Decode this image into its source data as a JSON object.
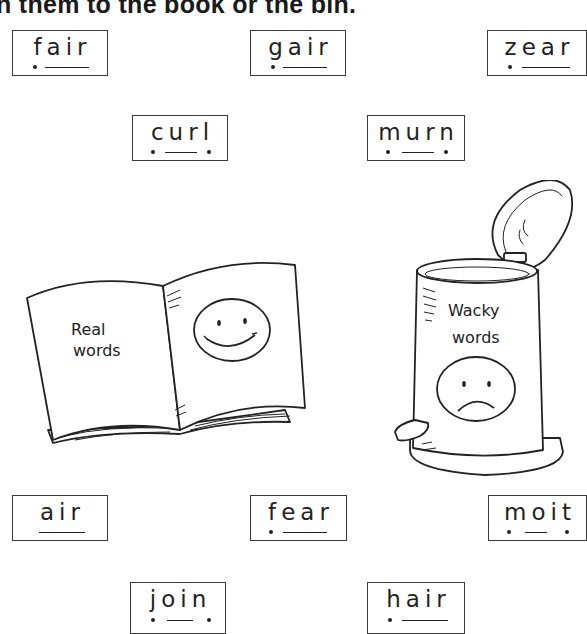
{
  "instruction": "n them to the book or the bin.",
  "cards": [
    {
      "id": "fair",
      "word": "fair",
      "pattern": "dot-line"
    },
    {
      "id": "gair",
      "word": "gair",
      "pattern": "dot-line"
    },
    {
      "id": "zear",
      "word": "zear",
      "pattern": "dot-line"
    },
    {
      "id": "curl",
      "word": "curl",
      "pattern": "dot-line-dot"
    },
    {
      "id": "murn",
      "word": "murn",
      "pattern": "dot-line-dot"
    },
    {
      "id": "air",
      "word": "air",
      "pattern": "line"
    },
    {
      "id": "fear",
      "word": "fear",
      "pattern": "dot-line"
    },
    {
      "id": "moit",
      "word": "moit",
      "pattern": "dot-line-dot"
    },
    {
      "id": "join",
      "word": "join",
      "pattern": "dot-line-dot"
    },
    {
      "id": "hair",
      "word": "hair",
      "pattern": "dot-line"
    }
  ],
  "book": {
    "label_line1": "Real",
    "label_line2": "words",
    "face": "smiley-face-icon"
  },
  "bin": {
    "label_line1": "Wacky",
    "label_line2": "words",
    "face": "sad-face-icon"
  }
}
